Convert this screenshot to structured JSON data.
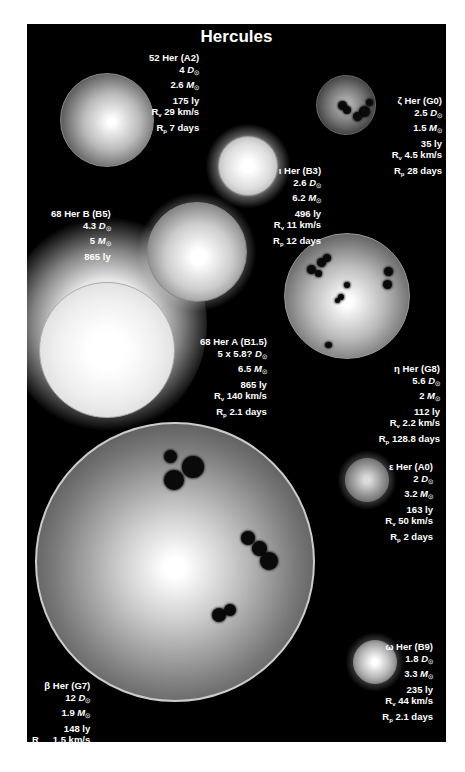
{
  "title": "Hercules",
  "stars": [
    {
      "id": "52-her",
      "name": "52 Her (A2)",
      "diameter": "4",
      "mass": "2.6",
      "distance": "175 ly",
      "rv": "29 km/s",
      "rp": "7 days"
    },
    {
      "id": "zeta-her",
      "name": "ζ Her (G0)",
      "diameter": "2.5",
      "mass": "1.5",
      "distance": "35 ly",
      "rv": "4.5 km/s",
      "rp": "28 days"
    },
    {
      "id": "iota-her",
      "name": "ι Her (B3)",
      "diameter": "2.6",
      "mass": "6.2",
      "distance": "496 ly",
      "rv": "11 km/s",
      "rp": "12 days"
    },
    {
      "id": "68-her-b",
      "name": "68 Her B (B5)",
      "diameter": "4.3",
      "mass": "5",
      "distance": "865 ly"
    },
    {
      "id": "68-her-a",
      "name": "68 Her A (B1.5)",
      "diameter": "5 x 5.8?",
      "mass": "6.5",
      "distance": "865 ly",
      "rv": "140 km/s",
      "rp": "2.1 days"
    },
    {
      "id": "eta-her",
      "name": "η Her (G8)",
      "diameter": "5.6",
      "mass": "2",
      "distance": "112 ly",
      "rv": "2.2 km/s",
      "rp": "128.8 days"
    },
    {
      "id": "epsilon-her",
      "name": "ε Her (A0)",
      "diameter": "2",
      "mass": "3.2",
      "distance": "163 ly",
      "rv": "50 km/s",
      "rp": "2 days"
    },
    {
      "id": "omega-her",
      "name": "ω Her (B9)",
      "diameter": "1.8",
      "mass": "3.3",
      "distance": "235 ly",
      "rv": "44 km/s",
      "rp": "2.1 days"
    },
    {
      "id": "beta-her",
      "name": "β Her (G7)",
      "diameter": "12",
      "mass": "1.9",
      "distance": "148 ly",
      "rv": "1.5 km/s",
      "rp": "126.5 days"
    }
  ],
  "symbols": {
    "D": "D",
    "M": "M",
    "sun": "☉",
    "Rv": "R",
    "v": "v",
    "Rp": "R",
    "p": "p"
  }
}
